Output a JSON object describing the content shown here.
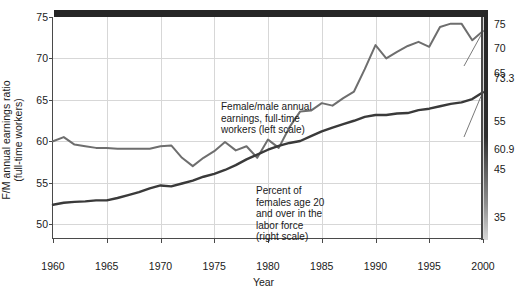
{
  "chart_data": {
    "type": "line",
    "title": "",
    "xlabel": "Year",
    "ylabel_left": "F/M annual earnings ratio\n(full-time workers)",
    "grid": true,
    "legend": "inline-annotations",
    "xlim": [
      1960,
      2000
    ],
    "xticks": [
      1960,
      1965,
      1970,
      1975,
      1980,
      1985,
      1990,
      1995,
      2000
    ],
    "xticklabels": [
      "1960",
      "1965",
      "1970",
      "1975",
      "1980",
      "1985",
      "1990",
      "1995",
      "2000"
    ],
    "ylim_left": [
      48.2,
      75
    ],
    "yticks_left": [
      50,
      55,
      60,
      65,
      70,
      75
    ],
    "yticklabels_left": [
      "50",
      "55",
      "60",
      "65",
      "70",
      "75"
    ],
    "ylim_right": [
      30.5,
      76.5
    ],
    "yticks_right": [
      35,
      45,
      55,
      65,
      70,
      75
    ],
    "yticklabels_right": [
      "35",
      "45",
      "55",
      "65",
      "70",
      "75"
    ],
    "series": [
      {
        "name": "Female/male annual earnings, full-time workers (left scale)",
        "axis": "left",
        "color": "#6e6e6e",
        "x": [
          1960,
          1961,
          1962,
          1963,
          1964,
          1965,
          1966,
          1967,
          1968,
          1969,
          1970,
          1971,
          1972,
          1973,
          1974,
          1975,
          1976,
          1977,
          1978,
          1979,
          1980,
          1981,
          1982,
          1983,
          1984,
          1985,
          1986,
          1987,
          1988,
          1989,
          1990,
          1991,
          1992,
          1993,
          1994,
          1995,
          1996,
          1997,
          1998,
          1999,
          2000
        ],
        "values": [
          60.0,
          60.5,
          59.6,
          59.4,
          59.2,
          59.2,
          59.1,
          59.1,
          59.1,
          59.1,
          59.4,
          59.5,
          58.0,
          57.0,
          58.0,
          58.8,
          59.9,
          58.9,
          59.4,
          58.0,
          60.2,
          59.2,
          61.7,
          63.6,
          63.7,
          64.6,
          64.3,
          65.2,
          66.0,
          68.7,
          71.6,
          70.0,
          70.8,
          71.5,
          72.0,
          71.4,
          73.8,
          74.2,
          74.2,
          72.2,
          73.3
        ]
      },
      {
        "name": "Percent of females age 20 and over in the labor force (right scale)",
        "axis": "right",
        "color": "#3a3a3a",
        "x": [
          1960,
          1961,
          1962,
          1963,
          1964,
          1965,
          1966,
          1967,
          1968,
          1969,
          1970,
          1971,
          1972,
          1973,
          1974,
          1975,
          1976,
          1977,
          1978,
          1979,
          1980,
          1981,
          1982,
          1983,
          1984,
          1985,
          1986,
          1987,
          1988,
          1989,
          1990,
          1991,
          1992,
          1993,
          1994,
          1995,
          1996,
          1997,
          1998,
          1999,
          2000
        ],
        "values": [
          37.6,
          38.0,
          38.2,
          38.3,
          38.5,
          38.5,
          39.0,
          39.6,
          40.2,
          41.0,
          41.6,
          41.4,
          42.0,
          42.6,
          43.4,
          44.0,
          44.8,
          45.8,
          47.0,
          48.0,
          49.0,
          49.8,
          50.4,
          50.8,
          51.8,
          52.8,
          53.6,
          54.3,
          55.0,
          55.8,
          56.2,
          56.2,
          56.5,
          56.6,
          57.2,
          57.5,
          58.0,
          58.5,
          58.8,
          59.5,
          60.9
        ]
      }
    ],
    "data_labels": [
      {
        "text": "73.3",
        "series": "Female/male annual earnings, full-time workers (left scale)",
        "year": 2000
      },
      {
        "text": "60.9",
        "series": "Percent of females age 20 and over in the labor force (right scale)",
        "year": 2000
      }
    ],
    "annotations": [
      {
        "id": "earnings",
        "text": "Female/male annual\nearnings, full-time\nworkers (left scale)"
      },
      {
        "id": "labor",
        "text": "Percent of\nfemales age 20\nand over in the\nlabor force\n(right scale)"
      }
    ]
  },
  "colors": {
    "series_light": "#6e6e6e",
    "series_dark": "#3a3a3a",
    "grid": "#d7d7d7",
    "axis": "#4a4a4a",
    "frame_shadow": "#262626",
    "background": "#ffffff",
    "text": "#1a1a1a"
  }
}
